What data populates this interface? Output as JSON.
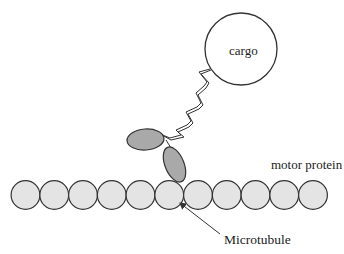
{
  "diagram": {
    "labels": {
      "cargo": "cargo",
      "motor_protein": "motor protein",
      "microtubule": "Microtubule"
    },
    "colors": {
      "stroke": "#333333",
      "tubulin_fill": "#e4e4e4",
      "motor_head_fill": "#a9a9a9",
      "cargo_fill": "#ffffff"
    },
    "microtubule": {
      "subunit_count": 11,
      "start_x": 25.5,
      "spacing": 28.75,
      "center_y": 195,
      "radius": 14.4
    },
    "cargo": {
      "cx": 241,
      "cy": 49,
      "r": 36
    },
    "motor_heads": [
      {
        "cx": 145.5,
        "cy": 139.5,
        "rx": 18.5,
        "ry": 10.5,
        "rotate": -4
      },
      {
        "cx": 174.5,
        "cy": 164.5,
        "rx": 9.5,
        "ry": 18.5,
        "rotate": -22
      }
    ],
    "arrow": {
      "x1": 220,
      "y1": 234,
      "x2": 180,
      "y2": 203
    }
  }
}
